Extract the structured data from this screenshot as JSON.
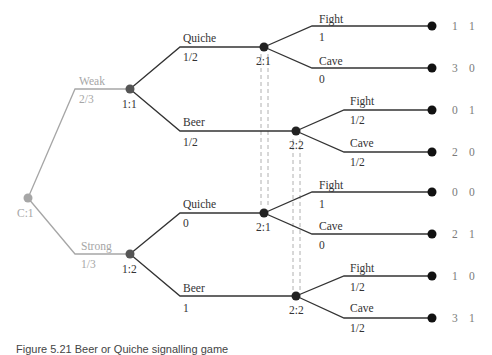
{
  "diagram": {
    "type": "extensive-form game tree",
    "caption": "Figure 5.21  Beer or Quiche signalling game",
    "colors": {
      "chance": "#a6a6a6",
      "player": "#333333",
      "payoff": "#7a7a7a",
      "info_set": "#b0b0b0"
    },
    "nodes": {
      "chance": {
        "label": "C:1"
      },
      "p1_weak": {
        "label": "1:1"
      },
      "p1_strong": {
        "label": "1:2"
      },
      "p2_quiche_weak": {
        "label": "2:1"
      },
      "p2_beer_weak": {
        "label": "2:2"
      },
      "p2_quiche_strong": {
        "label": "2:1"
      },
      "p2_beer_strong": {
        "label": "2:2"
      }
    },
    "chance_moves": [
      {
        "label": "Weak",
        "prob": "2/3"
      },
      {
        "label": "Strong",
        "prob": "1/3"
      }
    ],
    "p1_moves": [
      {
        "type": "Weak",
        "label": "Quiche",
        "prob": "1/2"
      },
      {
        "type": "Weak",
        "label": "Beer",
        "prob": "1/2"
      },
      {
        "type": "Strong",
        "label": "Quiche",
        "prob": "0"
      },
      {
        "type": "Strong",
        "label": "Beer",
        "prob": "1"
      }
    ],
    "p2_moves": [
      {
        "label": "Fight",
        "prob": "1"
      },
      {
        "label": "Cave",
        "prob": "0"
      },
      {
        "label": "Fight",
        "prob": "1/2"
      },
      {
        "label": "Cave",
        "prob": "1/2"
      },
      {
        "label": "Fight",
        "prob": "1"
      },
      {
        "label": "Cave",
        "prob": "0"
      },
      {
        "label": "Fight",
        "prob": "1/2"
      },
      {
        "label": "Cave",
        "prob": "1/2"
      }
    ],
    "payoffs": [
      {
        "p1": "1",
        "p2": "1"
      },
      {
        "p1": "3",
        "p2": "0"
      },
      {
        "p1": "0",
        "p2": "1"
      },
      {
        "p1": "2",
        "p2": "0"
      },
      {
        "p1": "0",
        "p2": "0"
      },
      {
        "p1": "2",
        "p2": "1"
      },
      {
        "p1": "1",
        "p2": "0"
      },
      {
        "p1": "3",
        "p2": "1"
      }
    ]
  }
}
